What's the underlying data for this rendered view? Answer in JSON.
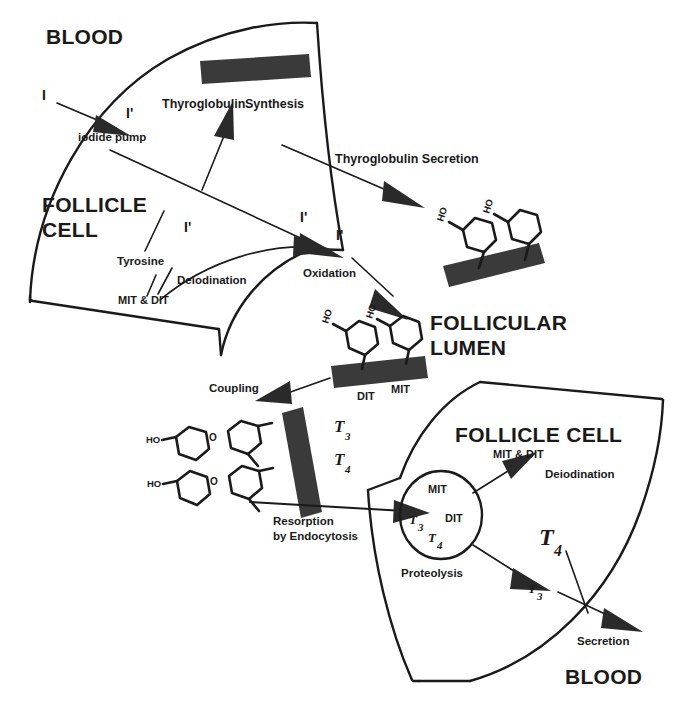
{
  "diagram": {
    "colors": {
      "ink": "#1a1a1a",
      "fill_bar": "#3a3a3a",
      "background": "#ffffff"
    },
    "compartments": [
      {
        "id": "blood-top",
        "label": "BLOOD"
      },
      {
        "id": "follicle-cell-top",
        "label_line1": "FOLLICLE",
        "label_line2": "CELL"
      },
      {
        "id": "follicular-lumen",
        "label_line1": "FOLLICULAR",
        "label_line2": "LUMEN"
      },
      {
        "id": "follicle-cell-bottom",
        "label": "FOLLICLE CELL"
      },
      {
        "id": "blood-bottom",
        "label": "BLOOD"
      }
    ],
    "processes": {
      "iodide_pump": "iodide pump",
      "thyroglobulin_synthesis_part1": "Thyroglobulin",
      "thyroglobulin_synthesis_part2": "Synthesis",
      "thyroglobulin_secretion": "Thyroglobulin Secretion",
      "tyrosine": "Tyrosine",
      "deiodination_top": "Deiodination",
      "oxidation": "Oxidation",
      "coupling": "Coupling",
      "resorption_line1": "Resorption",
      "resorption_line2": "by Endocytosis",
      "proteolysis": "Proteolysis",
      "deiodination_bottom": "Deiodination",
      "secretion": "Secretion"
    },
    "species": {
      "iodide_blood": "I",
      "iodide_cell_1": "I'",
      "iodide_cell_2": "I'",
      "iodide_cell_3": "I'",
      "iodide_lumen": "I'",
      "mit_dit_top": "MIT & DIT",
      "mit_dit_bottom": "MIT & DIT",
      "dit_lumen": "DIT",
      "mit_lumen": "MIT",
      "mit_vesicle": "MIT",
      "dit_vesicle": "DIT",
      "ho_label": "HO",
      "o_label": "O"
    },
    "hormones": {
      "t3_coupling": "T",
      "t3_coupling_sub": "3",
      "t4_coupling": "T",
      "t4_coupling_sub": "4",
      "t3_vesicle": "T",
      "t3_vesicle_sub": "3",
      "t4_vesicle": "T",
      "t4_vesicle_sub": "4",
      "t4_secreted": "T",
      "t4_secreted_sub": "4",
      "t3_secreted": "T",
      "t3_secreted_sub": "3"
    }
  }
}
